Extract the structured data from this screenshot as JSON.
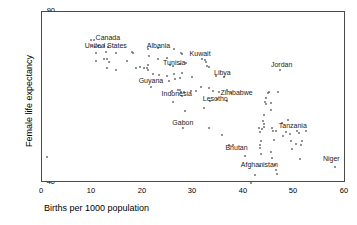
{
  "chart_data": {
    "type": "scatter",
    "title": "",
    "xlabel": "Births per 1000 population",
    "ylabel": "Female life expectancy",
    "xlim": [
      0,
      60
    ],
    "ylim": [
      40,
      90
    ],
    "xticks": [
      0,
      10,
      20,
      30,
      40,
      50,
      60
    ],
    "yticks": [
      40,
      50,
      60,
      70,
      80,
      90
    ],
    "grid": false,
    "legend": null,
    "marker_color": "#6f6f6f",
    "axis_color": "#4a4a4a",
    "annotations": [
      {
        "text": "Canada",
        "x": 13.0,
        "y": 82.4
      },
      {
        "text": "United States",
        "x": 12.6,
        "y": 80.1
      },
      {
        "text": "Albania",
        "x": 23.0,
        "y": 80.2
      },
      {
        "text": "Kuwait",
        "x": 31.2,
        "y": 77.6
      },
      {
        "text": "Tunisia",
        "x": 26.1,
        "y": 75.2
      },
      {
        "text": "Jordan",
        "x": 47.3,
        "y": 74.6
      },
      {
        "text": "Libya",
        "x": 35.6,
        "y": 72.2
      },
      {
        "text": "Guyana",
        "x": 21.5,
        "y": 69.7
      },
      {
        "text": "Indonesia",
        "x": 26.6,
        "y": 66.0
      },
      {
        "text": "Zimbabwe",
        "x": 38.4,
        "y": 66.3
      },
      {
        "text": "Lesotho",
        "x": 34.2,
        "y": 64.6
      },
      {
        "text": "Gabon",
        "x": 27.8,
        "y": 57.5
      },
      {
        "text": "Tanzania",
        "x": 49.5,
        "y": 56.6
      },
      {
        "text": "Bhutan",
        "x": 38.4,
        "y": 50.3
      },
      {
        "text": "Afghanistan",
        "x": 42.9,
        "y": 45.2
      },
      {
        "text": "Niger",
        "x": 57.1,
        "y": 47.0
      }
    ],
    "points": [
      {
        "x": 1.0,
        "y": 47.6
      },
      {
        "x": 9.7,
        "y": 81.8
      },
      {
        "x": 10.2,
        "y": 81.7
      },
      {
        "x": 9.9,
        "y": 80.1
      },
      {
        "x": 10.4,
        "y": 79.9
      },
      {
        "x": 11.0,
        "y": 80.0
      },
      {
        "x": 11.6,
        "y": 79.9
      },
      {
        "x": 12.2,
        "y": 80.2
      },
      {
        "x": 13.0,
        "y": 79.9
      },
      {
        "x": 10.7,
        "y": 78.1
      },
      {
        "x": 12.6,
        "y": 78.3
      },
      {
        "x": 14.6,
        "y": 78.0
      },
      {
        "x": 17.8,
        "y": 78.3
      },
      {
        "x": 17.9,
        "y": 77.9
      },
      {
        "x": 10.6,
        "y": 75.6
      },
      {
        "x": 12.3,
        "y": 76.3
      },
      {
        "x": 12.9,
        "y": 76.2
      },
      {
        "x": 13.2,
        "y": 75.3
      },
      {
        "x": 16.7,
        "y": 75.7
      },
      {
        "x": 12.8,
        "y": 73.6
      },
      {
        "x": 14.6,
        "y": 72.9
      },
      {
        "x": 18.6,
        "y": 73.7
      },
      {
        "x": 19.4,
        "y": 73.8
      },
      {
        "x": 20.2,
        "y": 73.7
      },
      {
        "x": 20.8,
        "y": 73.6
      },
      {
        "x": 20.9,
        "y": 74.4
      },
      {
        "x": 20.9,
        "y": 73.0
      },
      {
        "x": 21.0,
        "y": 79.2
      },
      {
        "x": 22.9,
        "y": 79.4
      },
      {
        "x": 21.1,
        "y": 77.0
      },
      {
        "x": 22.8,
        "y": 76.2
      },
      {
        "x": 24.6,
        "y": 76.5
      },
      {
        "x": 26.0,
        "y": 79.2
      },
      {
        "x": 27.5,
        "y": 78.0
      },
      {
        "x": 27.7,
        "y": 77.7
      },
      {
        "x": 25.2,
        "y": 74.6
      },
      {
        "x": 25.9,
        "y": 74.3
      },
      {
        "x": 27.2,
        "y": 74.9
      },
      {
        "x": 28.5,
        "y": 75.2
      },
      {
        "x": 22.0,
        "y": 71.9
      },
      {
        "x": 23.1,
        "y": 71.7
      },
      {
        "x": 24.7,
        "y": 71.2
      },
      {
        "x": 26.1,
        "y": 72.0
      },
      {
        "x": 27.6,
        "y": 72.1
      },
      {
        "x": 21.5,
        "y": 68.2
      },
      {
        "x": 25.0,
        "y": 69.8
      },
      {
        "x": 26.3,
        "y": 70.5
      },
      {
        "x": 27.3,
        "y": 70.8
      },
      {
        "x": 29.6,
        "y": 70.9
      },
      {
        "x": 31.6,
        "y": 76.3
      },
      {
        "x": 32.2,
        "y": 76.0
      },
      {
        "x": 32.3,
        "y": 75.4
      },
      {
        "x": 32.6,
        "y": 74.3
      },
      {
        "x": 32.9,
        "y": 74.0
      },
      {
        "x": 34.4,
        "y": 71.2
      },
      {
        "x": 35.9,
        "y": 71.0
      },
      {
        "x": 25.7,
        "y": 67.0
      },
      {
        "x": 26.9,
        "y": 67.3
      },
      {
        "x": 27.3,
        "y": 67.2
      },
      {
        "x": 27.4,
        "y": 66.6
      },
      {
        "x": 28.0,
        "y": 66.6
      },
      {
        "x": 29.5,
        "y": 67.0
      },
      {
        "x": 30.3,
        "y": 67.0
      },
      {
        "x": 25.9,
        "y": 63.6
      },
      {
        "x": 27.6,
        "y": 65.3
      },
      {
        "x": 31.4,
        "y": 68.2
      },
      {
        "x": 33.0,
        "y": 67.9
      },
      {
        "x": 33.8,
        "y": 66.9
      },
      {
        "x": 35.0,
        "y": 66.7
      },
      {
        "x": 36.5,
        "y": 67.1
      },
      {
        "x": 37.3,
        "y": 66.3
      },
      {
        "x": 33.2,
        "y": 64.1
      },
      {
        "x": 34.5,
        "y": 64.5
      },
      {
        "x": 36.5,
        "y": 64.1
      },
      {
        "x": 28.3,
        "y": 61.0
      },
      {
        "x": 31.9,
        "y": 61.8
      },
      {
        "x": 27.8,
        "y": 56.1
      },
      {
        "x": 33.0,
        "y": 56.1
      },
      {
        "x": 35.5,
        "y": 54.0
      },
      {
        "x": 37.0,
        "y": 51.0
      },
      {
        "x": 37.6,
        "y": 51.2
      },
      {
        "x": 40.0,
        "y": 47.9
      },
      {
        "x": 41.3,
        "y": 40.1
      },
      {
        "x": 42.0,
        "y": 42.3
      },
      {
        "x": 43.0,
        "y": 45.0
      },
      {
        "x": 43.2,
        "y": 48.6
      },
      {
        "x": 43.0,
        "y": 50.2
      },
      {
        "x": 43.1,
        "y": 51.1
      },
      {
        "x": 43.2,
        "y": 52.2
      },
      {
        "x": 43.1,
        "y": 54.8
      },
      {
        "x": 42.9,
        "y": 56.0
      },
      {
        "x": 43.4,
        "y": 55.9
      },
      {
        "x": 43.8,
        "y": 56.3
      },
      {
        "x": 43.9,
        "y": 57.2
      },
      {
        "x": 43.6,
        "y": 58.0
      },
      {
        "x": 43.9,
        "y": 59.9
      },
      {
        "x": 44.2,
        "y": 63.0
      },
      {
        "x": 44.0,
        "y": 63.8
      },
      {
        "x": 44.3,
        "y": 65.0
      },
      {
        "x": 44.6,
        "y": 66.4
      },
      {
        "x": 44.8,
        "y": 66.5
      },
      {
        "x": 45.1,
        "y": 63.3
      },
      {
        "x": 45.2,
        "y": 61.3
      },
      {
        "x": 45.3,
        "y": 56.0
      },
      {
        "x": 45.6,
        "y": 55.1
      },
      {
        "x": 46.2,
        "y": 55.2
      },
      {
        "x": 45.8,
        "y": 52.5
      },
      {
        "x": 45.2,
        "y": 49.1
      },
      {
        "x": 45.4,
        "y": 47.4
      },
      {
        "x": 46.0,
        "y": 45.3
      },
      {
        "x": 46.1,
        "y": 43.9
      },
      {
        "x": 46.4,
        "y": 42.7
      },
      {
        "x": 46.9,
        "y": 73.0
      },
      {
        "x": 46.6,
        "y": 66.6
      },
      {
        "x": 47.3,
        "y": 57.5
      },
      {
        "x": 47.6,
        "y": 53.6
      },
      {
        "x": 48.2,
        "y": 55.0
      },
      {
        "x": 48.6,
        "y": 58.3
      },
      {
        "x": 48.9,
        "y": 54.3
      },
      {
        "x": 49.2,
        "y": 52.2
      },
      {
        "x": 49.3,
        "y": 50.0
      },
      {
        "x": 50.1,
        "y": 51.3
      },
      {
        "x": 50.3,
        "y": 55.3
      },
      {
        "x": 50.7,
        "y": 54.6
      },
      {
        "x": 51.0,
        "y": 47.0
      },
      {
        "x": 51.2,
        "y": 51.0
      },
      {
        "x": 51.4,
        "y": 52.2
      },
      {
        "x": 52.1,
        "y": 55.1
      },
      {
        "x": 57.8,
        "y": 44.6
      }
    ]
  }
}
